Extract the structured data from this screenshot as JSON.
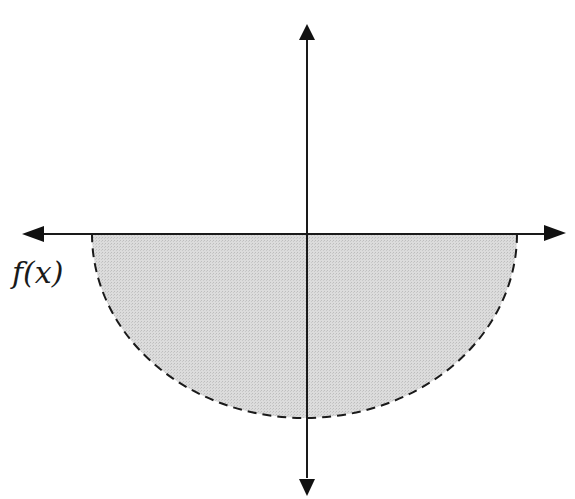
{
  "figure": {
    "label": "f(x)",
    "colors": {
      "axis": "#1a1a1a",
      "fill": "#d9d9d9",
      "curve": "#1a1a1a",
      "background": "#ffffff"
    },
    "axes": {
      "horizontal": {
        "arrows": [
          "left",
          "right"
        ]
      },
      "vertical": {
        "arrows": [
          "up",
          "down"
        ]
      }
    },
    "region": {
      "shape": "lower half-ellipse",
      "boundary_style": "dashed",
      "shaded": true
    }
  }
}
